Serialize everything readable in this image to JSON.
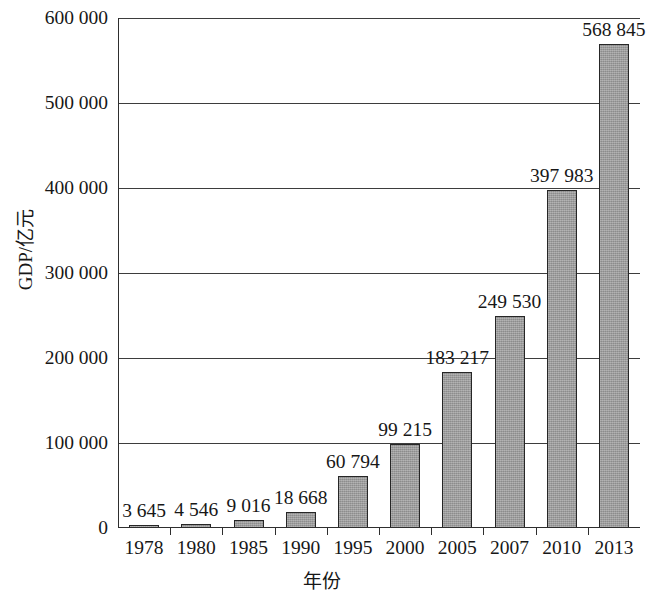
{
  "chart_data": {
    "type": "bar",
    "title": "",
    "xlabel": "年份",
    "ylabel": "GDP/亿元",
    "categories": [
      "1978",
      "1980",
      "1985",
      "1990",
      "1995",
      "2000",
      "2005",
      "2007",
      "2010",
      "2013"
    ],
    "values": [
      3645,
      4546,
      9016,
      18668,
      60794,
      99215,
      183217,
      249530,
      397983,
      568845
    ],
    "value_labels": [
      "3 645",
      "4 546",
      "9 016",
      "18 668",
      "60 794",
      "99 215",
      "183 217",
      "249 530",
      "397 983",
      "568 845"
    ],
    "ylim": [
      0,
      600000
    ],
    "y_ticks": [
      0,
      100000,
      200000,
      300000,
      400000,
      500000,
      600000
    ],
    "y_tick_labels": [
      "0",
      "100 000",
      "200 000",
      "300 000",
      "400 000",
      "500 000",
      "600 000"
    ],
    "grid": true,
    "legend": null,
    "series_color": "#9a9a9a",
    "border_color": "#262626",
    "axis_color": "#2e2e2e"
  }
}
